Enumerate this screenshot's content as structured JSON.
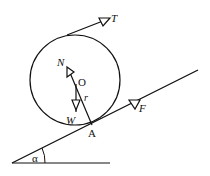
{
  "diagram": {
    "labels": {
      "tension": "T",
      "normal": "N",
      "center": "O",
      "radius": "r",
      "weight": "W",
      "contact_point": "A",
      "friction": "F",
      "angle": "α"
    },
    "colors": {
      "stroke": "#111111",
      "background": "#ffffff"
    }
  }
}
